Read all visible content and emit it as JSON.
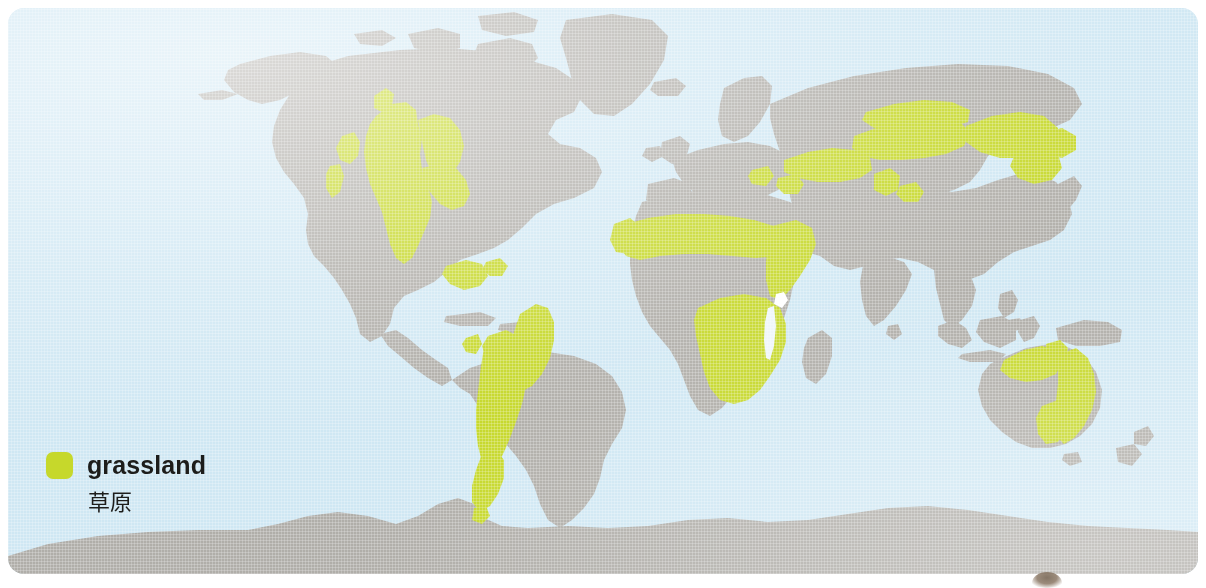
{
  "figure": {
    "kind": "thematic-world-map"
  },
  "colors": {
    "ocean": "#cfe7f3",
    "land": "#b0aea9",
    "grassland": "#c6d82b",
    "legend_text": "#1d1d1b",
    "page_background": "#ffffff"
  },
  "legend": {
    "swatch_icon": "grassland-color-swatch",
    "label_en": "grassland",
    "label_zh": "草原"
  },
  "map": {
    "projection": "equirectangular",
    "land_regions": [
      "North America",
      "Greenland",
      "Canadian Arctic Archipelago",
      "Iceland",
      "South America",
      "Europe",
      "Scandinavia",
      "British Isles",
      "Africa",
      "Madagascar",
      "Asia",
      "Arabian Peninsula",
      "Indian subcontinent",
      "Southeast Asia",
      "Indonesia",
      "Philippines",
      "Japan",
      "Australia",
      "New Guinea",
      "New Zealand",
      "Antarctica"
    ],
    "grassland_regions": [
      "North American Great Plains / Prairie",
      "Intermountain West sagebrush steppe",
      "Central Valley California",
      "Llanos of Venezuela and Colombia",
      "Brazilian Cerrado",
      "Gran Chaco",
      "Argentine Pampas",
      "Patagonian steppe",
      "African Sahel",
      "East African savanna",
      "Southern African savanna and veld",
      "Ukrainian and Russian steppe",
      "Kazakh steppe",
      "Mongolian steppe",
      "Northern Australian tropical savanna",
      "Eastern Australian grassland"
    ]
  }
}
